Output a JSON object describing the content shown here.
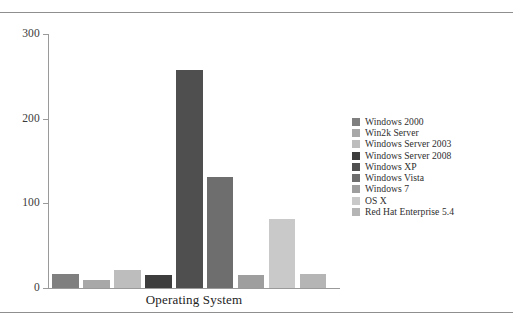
{
  "figure": {
    "x_axis_title": "Operating System",
    "y_axis_ticks": [
      "0",
      "100",
      "200",
      "300"
    ],
    "top_rule": "horizontal-rule",
    "bottom_rule": "horizontal-rule"
  },
  "legend": {
    "items": [
      {
        "label": "Windows 2000",
        "color": "#7f7f7f"
      },
      {
        "label": "Win2k Server",
        "color": "#a8a8a8"
      },
      {
        "label": "Windows Server 2003",
        "color": "#bdbdbd"
      },
      {
        "label": "Windows Server 2008",
        "color": "#3d3d3d"
      },
      {
        "label": "Windows XP",
        "color": "#4f4f4f"
      },
      {
        "label": "Windows Vista",
        "color": "#6e6e6e"
      },
      {
        "label": "Windows 7",
        "color": "#9e9e9e"
      },
      {
        "label": "OS X",
        "color": "#c9c9c9"
      },
      {
        "label": "Red Hat Enterprise 5.4",
        "color": "#b5b5b5"
      }
    ]
  },
  "chart_data": {
    "type": "bar",
    "title": "",
    "xlabel": "Operating System",
    "ylabel": "",
    "ylim": [
      0,
      300
    ],
    "yticks": [
      0,
      100,
      200,
      300
    ],
    "grid": false,
    "legend_position": "right",
    "categories": [
      "Windows 2000",
      "Win2k Server",
      "Windows Server 2003",
      "Windows Server 2008",
      "Windows XP",
      "Windows Vista",
      "Windows 7",
      "OS X",
      "Red Hat Enterprise 5.4"
    ],
    "values": [
      16,
      10,
      21,
      15,
      257,
      131,
      15,
      82,
      17
    ],
    "colors": [
      "#7f7f7f",
      "#a8a8a8",
      "#bdbdbd",
      "#3d3d3d",
      "#4f4f4f",
      "#6e6e6e",
      "#9e9e9e",
      "#c9c9c9",
      "#b5b5b5"
    ]
  }
}
